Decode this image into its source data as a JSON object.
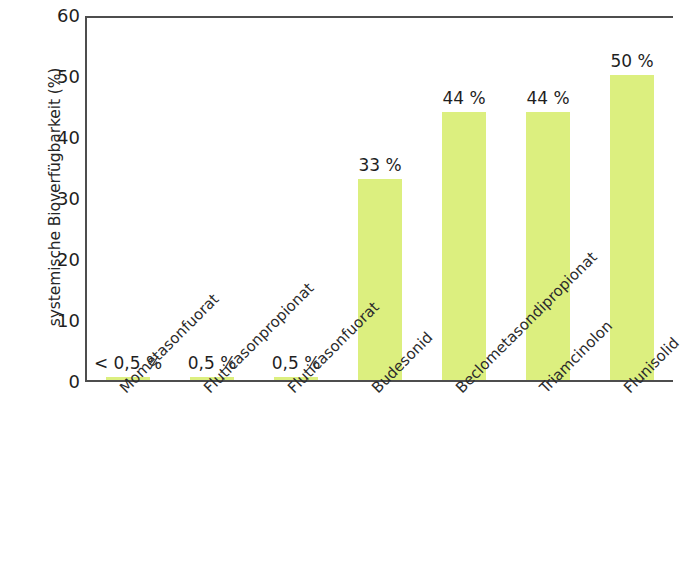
{
  "chart_data": {
    "type": "bar",
    "title": "",
    "subtitle": "",
    "xlabel": "",
    "ylabel": "systemische Bioverfügbarkeit (%)",
    "ylim": [
      0,
      60
    ],
    "ytick_labels": [
      "60",
      "50",
      "40",
      "30",
      "20",
      "10",
      "0"
    ],
    "ytick_values": [
      60,
      50,
      40,
      30,
      20,
      10,
      0
    ],
    "grid": false,
    "legend": "none",
    "bar_color": "#dcef7f",
    "axis_color": "#4d4d4d",
    "text_color": "#1f1f1f",
    "categories": [
      "Mometasonfuorat",
      "Fluticasonpropionat",
      "Fluticasonfuorat",
      "Budesonid",
      "Beclometasondipropionat",
      "Triamcinolon",
      "Flunisolid"
    ],
    "values": [
      0.4,
      0.5,
      0.5,
      33,
      44,
      44,
      50
    ],
    "data_labels": [
      "< 0,5 %",
      "0,5 %",
      "0,5 %",
      "33 %",
      "44 %",
      "44 %",
      "50 %"
    ]
  }
}
